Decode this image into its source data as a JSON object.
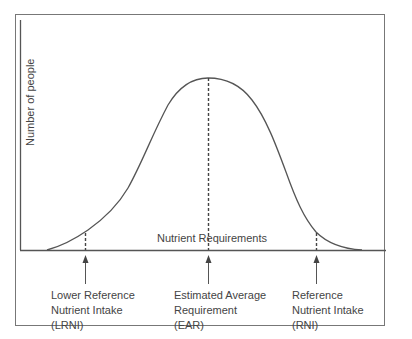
{
  "diagram": {
    "title": "",
    "y_axis_label": "Number of people",
    "x_axis_label": "Nutrient Requirements",
    "curve": "normal distribution of nutrient requirements",
    "colors": {
      "line": "#555555",
      "frame": "#777777",
      "background": "#ffffff"
    },
    "markers": [
      {
        "id": "lrni",
        "lines": [
          "Lower Reference",
          "Nutrient Intake",
          "(LRNI)"
        ],
        "position": "low tail (approx. mean - 2 SD)"
      },
      {
        "id": "ear",
        "lines": [
          "Estimated Average",
          "Requirement",
          "(EAR)"
        ],
        "position": "peak (mean)"
      },
      {
        "id": "rni",
        "lines": [
          "Reference",
          "Nutrient Intake",
          "(RNI)"
        ],
        "position": "high tail (approx. mean + 2 SD)"
      }
    ]
  }
}
